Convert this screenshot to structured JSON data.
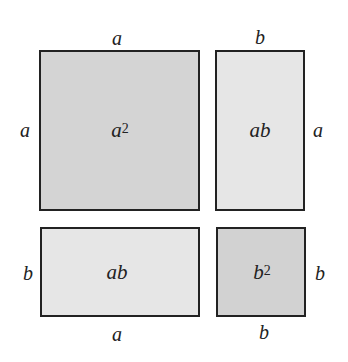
{
  "diagram": {
    "regions": [
      {
        "id": "a-squared",
        "base": "a",
        "exponent": "2",
        "top_label": "a",
        "side_label": "a",
        "color": "#d4d4d4"
      },
      {
        "id": "ab-top",
        "label": "ab",
        "top_label": "b",
        "side_label": "a",
        "color": "#e6e6e6"
      },
      {
        "id": "ab-bottom",
        "label": "ab",
        "side_label": "b",
        "bottom_label": "a",
        "color": "#e6e6e6"
      },
      {
        "id": "b-squared",
        "base": "b",
        "exponent": "2",
        "side_label": "b",
        "bottom_label": "b",
        "color": "#d2d2d2"
      }
    ]
  }
}
